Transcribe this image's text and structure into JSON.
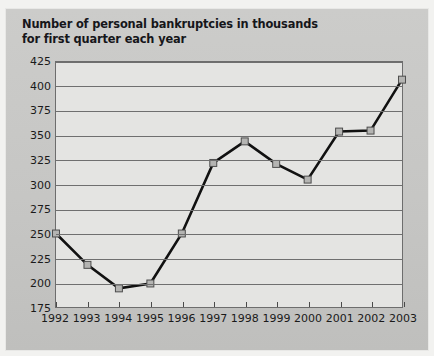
{
  "figure": {
    "title_line1": "Number of personal bankruptcies in thousands",
    "title_line2": "for first quarter each year",
    "panel_color": "#c9c9c7",
    "plot_background": "#e4e4e2",
    "line_color": "#111111",
    "marker_fill": "#b4b4b2",
    "grid_color": "#6f6f6f"
  },
  "chart_data": {
    "type": "line",
    "title": "Number of personal bankruptcies in thousands for first quarter each year",
    "xlabel": "",
    "ylabel": "",
    "categories": [
      "1992",
      "1993",
      "1994",
      "1995",
      "1996",
      "1997",
      "1998",
      "1999",
      "2000",
      "2001",
      "2002",
      "2003"
    ],
    "values": [
      250,
      218,
      194,
      199,
      250,
      322,
      344,
      321,
      305,
      354,
      355,
      407
    ],
    "ylim": [
      175,
      425
    ],
    "yticks": [
      175,
      200,
      225,
      250,
      275,
      300,
      325,
      350,
      375,
      400,
      425
    ],
    "ytick_labels": [
      "175",
      "200",
      "225",
      "250",
      "275",
      "300",
      "325",
      "350",
      "375",
      "400",
      "425"
    ],
    "grid": true,
    "legend": false,
    "markers": "square",
    "units": "thousands"
  }
}
